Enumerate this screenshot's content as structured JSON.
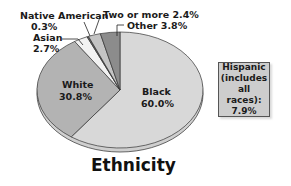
{
  "chart_data": {
    "type": "pie",
    "title": "Ethnicity",
    "slices": [
      {
        "label": "Black",
        "value": 60.0,
        "display": "60.0%",
        "color": "#d8d8d8"
      },
      {
        "label": "White",
        "value": 30.8,
        "display": "30.8%",
        "color": "#b3b3b3"
      },
      {
        "label": "Asian",
        "value": 2.7,
        "display": "2.7%",
        "color": "#f2f2f2"
      },
      {
        "label": "Native American",
        "value": 0.3,
        "display": "0.3%",
        "color": "#6a6a6a"
      },
      {
        "label": "Two or more",
        "value": 2.4,
        "display": "2.4%",
        "color": "#c4c4c4"
      },
      {
        "label": "Other",
        "value": 3.8,
        "display": "3.8%",
        "color": "#8c8c8c"
      }
    ],
    "callout": {
      "label": "Hispanic (includes all races):",
      "value": 7.9,
      "display": "7.9%"
    }
  },
  "labels": {
    "title": "Ethnicity",
    "black_name": "Black",
    "black_pct": "60.0%",
    "white_name": "White",
    "white_pct": "30.8%",
    "asian_name": "Asian",
    "asian_pct": "2.7%",
    "native_name": "Native American",
    "native_pct": "0.3%",
    "two_or_more": "Two or more 2.4%",
    "other": "Other 3.8%",
    "hispanic_line1": "Hispanic",
    "hispanic_line2": "(includes",
    "hispanic_line3": "all races):",
    "hispanic_line4": "7.9%"
  }
}
